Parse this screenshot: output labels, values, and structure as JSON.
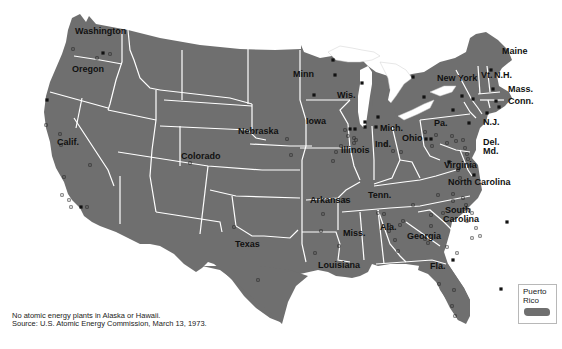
{
  "map": {
    "land_color": "#6f6f6f",
    "border_color": "#ffffff",
    "lake_color": "#ffffff",
    "marker_color": "#111111",
    "state_labels": [
      {
        "name": "Washington",
        "x": 75,
        "y": 36
      },
      {
        "name": "Oregon",
        "x": 72,
        "y": 74
      },
      {
        "name": "Calif.",
        "x": 57,
        "y": 147
      },
      {
        "name": "Colorado",
        "x": 181,
        "y": 161
      },
      {
        "name": "Nebraska",
        "x": 238,
        "y": 136
      },
      {
        "name": "Texas",
        "x": 235,
        "y": 249
      },
      {
        "name": "Minn",
        "x": 293,
        "y": 79
      },
      {
        "name": "Wis.",
        "x": 337,
        "y": 100
      },
      {
        "name": "Iowa",
        "x": 306,
        "y": 126
      },
      {
        "name": "Illinois",
        "x": 341,
        "y": 155
      },
      {
        "name": "Ind.",
        "x": 375,
        "y": 149
      },
      {
        "name": "Mich.",
        "x": 380,
        "y": 133
      },
      {
        "name": "Ohio",
        "x": 402,
        "y": 143
      },
      {
        "name": "Pa.",
        "x": 434,
        "y": 128
      },
      {
        "name": "New York",
        "x": 437,
        "y": 83
      },
      {
        "name": "Vt.",
        "x": 481,
        "y": 80
      },
      {
        "name": "N.H.",
        "x": 494,
        "y": 80
      },
      {
        "name": "Maine",
        "x": 502,
        "y": 56
      },
      {
        "name": "Mass.",
        "x": 508,
        "y": 94
      },
      {
        "name": "Conn.",
        "x": 508,
        "y": 106
      },
      {
        "name": "N.J.",
        "x": 483,
        "y": 127
      },
      {
        "name": "Del.",
        "x": 483,
        "y": 147
      },
      {
        "name": "Md.",
        "x": 483,
        "y": 156
      },
      {
        "name": "Virginia",
        "x": 444,
        "y": 170
      },
      {
        "name": "North Carolina",
        "x": 448,
        "y": 187
      },
      {
        "name": "South",
        "x": 445,
        "y": 215
      },
      {
        "name": "Carolina",
        "x": 443,
        "y": 224
      },
      {
        "name": "Tenn.",
        "x": 368,
        "y": 200
      },
      {
        "name": "Arkansas",
        "x": 310,
        "y": 205
      },
      {
        "name": "Miss.",
        "x": 343,
        "y": 238
      },
      {
        "name": "Ala.",
        "x": 380,
        "y": 232
      },
      {
        "name": "Georgia",
        "x": 407,
        "y": 241
      },
      {
        "name": "Louisiana",
        "x": 318,
        "y": 270
      },
      {
        "name": "Fla.",
        "x": 430,
        "y": 271
      }
    ],
    "plants": {
      "operable": [
        [
          103,
          53
        ],
        [
          47,
          100
        ],
        [
          81,
          207
        ],
        [
          333,
          60
        ],
        [
          314,
          95
        ],
        [
          335,
          75
        ],
        [
          362,
          83
        ],
        [
          413,
          77
        ],
        [
          365,
          122
        ],
        [
          365,
          127
        ],
        [
          376,
          127
        ],
        [
          378,
          117
        ],
        [
          350,
          129
        ],
        [
          355,
          129
        ],
        [
          424,
          97
        ],
        [
          462,
          96
        ],
        [
          473,
          99
        ],
        [
          493,
          89
        ],
        [
          491,
          70
        ],
        [
          496,
          101
        ],
        [
          487,
          113
        ],
        [
          499,
          107
        ],
        [
          453,
          110
        ],
        [
          426,
          139
        ],
        [
          431,
          139
        ],
        [
          469,
          123
        ],
        [
          474,
          175
        ],
        [
          449,
          162
        ],
        [
          507,
          222
        ],
        [
          453,
          260
        ],
        [
          501,
          289
        ]
      ],
      "under_construction": [
        [
          110,
          54
        ],
        [
          73,
          49
        ],
        [
          97,
          58
        ],
        [
          46,
          125
        ],
        [
          60,
          134
        ],
        [
          61,
          145
        ],
        [
          64,
          177
        ],
        [
          90,
          165
        ],
        [
          62,
          195
        ],
        [
          69,
          200
        ],
        [
          71,
          207
        ],
        [
          87,
          207
        ],
        [
          190,
          163
        ],
        [
          287,
          139
        ],
        [
          291,
          155
        ],
        [
          333,
          161
        ],
        [
          336,
          152
        ],
        [
          341,
          146
        ],
        [
          345,
          130
        ],
        [
          348,
          136
        ],
        [
          354,
          138
        ],
        [
          354,
          143
        ],
        [
          356,
          140
        ],
        [
          386,
          145
        ],
        [
          393,
          151
        ],
        [
          401,
          152
        ],
        [
          425,
          132
        ],
        [
          432,
          146
        ],
        [
          436,
          135
        ],
        [
          447,
          143
        ],
        [
          452,
          136
        ],
        [
          456,
          141
        ],
        [
          463,
          140
        ],
        [
          465,
          148
        ],
        [
          467,
          154
        ],
        [
          468,
          159
        ],
        [
          471,
          165
        ],
        [
          458,
          170
        ],
        [
          460,
          178
        ],
        [
          438,
          195
        ],
        [
          453,
          194
        ],
        [
          453,
          201
        ],
        [
          463,
          198
        ],
        [
          466,
          205
        ],
        [
          469,
          210
        ],
        [
          472,
          213
        ],
        [
          467,
          221
        ],
        [
          476,
          228
        ],
        [
          472,
          238
        ],
        [
          480,
          236
        ],
        [
          443,
          213
        ],
        [
          431,
          215
        ],
        [
          431,
          226
        ],
        [
          425,
          239
        ],
        [
          428,
          243
        ],
        [
          447,
          247
        ],
        [
          457,
          253
        ],
        [
          389,
          231
        ],
        [
          395,
          240
        ],
        [
          398,
          251
        ],
        [
          413,
          205
        ],
        [
          403,
          221
        ],
        [
          400,
          225
        ],
        [
          378,
          213
        ],
        [
          384,
          214
        ],
        [
          389,
          225
        ],
        [
          345,
          200
        ],
        [
          323,
          214
        ],
        [
          321,
          231
        ],
        [
          234,
          227
        ],
        [
          339,
          246
        ],
        [
          315,
          253
        ],
        [
          258,
          280
        ],
        [
          439,
          284
        ],
        [
          454,
          290
        ],
        [
          452,
          306
        ],
        [
          455,
          316
        ]
      ]
    }
  },
  "footnote": {
    "line1": "No atomic energy plants in Alaska or Hawaii.",
    "line2": "Source: U.S. Atomic Energy Commission, March 13, 1973."
  },
  "inset": {
    "label_line1": "Puerto",
    "label_line2": "Rico"
  }
}
